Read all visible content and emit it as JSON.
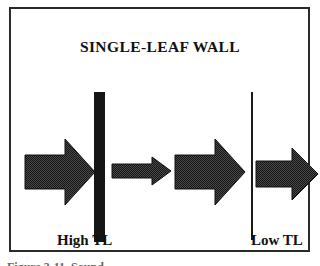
{
  "figure": {
    "title": "SINGLE-LEAF WALL",
    "frame": {
      "visible": true,
      "color": "#2b2b2b"
    },
    "labels": {
      "left": "High TL",
      "right": "Low TL"
    },
    "caption_partial": "Figure 3-11.  Sound",
    "colors": {
      "ink": "#111111",
      "fill": "#1a1a1a",
      "frame": "#2b2b2b",
      "background": "#ffffff"
    },
    "elements": {
      "wall_thick_name": "Single-leaf wall (thick)",
      "wall_thin_name": "Receiving-side wall (thin)",
      "arrow_incident": "Incident sound energy",
      "arrow_transmitted_small": "Reduced transmitted energy through high-TL wall",
      "arrow_incident_2": "Incident sound energy at low-TL wall",
      "arrow_transmitted_large": "Transmitted energy through low-TL wall"
    }
  }
}
